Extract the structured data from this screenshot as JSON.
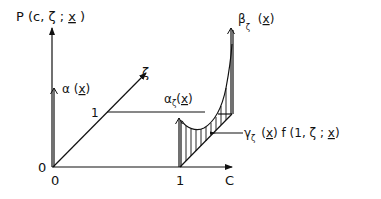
{
  "figure": {
    "type": "3d-probability-diagram",
    "axes": {
      "vertical": {
        "label": "P (c, ζ ; x)",
        "label_parts": [
          "P (c, ζ ; ",
          "x",
          " )"
        ]
      },
      "depth": {
        "label": "ζ"
      },
      "horizontal": {
        "label": "C"
      }
    },
    "ticks": {
      "origin_vertical": "0",
      "origin_horizontal": "0",
      "c_one": "1",
      "zeta_one": "1"
    },
    "annotations": {
      "alpha": {
        "symbol": "α",
        "open": " (",
        "arg": "x",
        "close": ")"
      },
      "alpha_zeta": {
        "symbol": "α",
        "sub": "ζ",
        "open": "(",
        "arg": "x",
        "close": ")"
      },
      "beta_zeta": {
        "symbol": "β",
        "sub": "ζ",
        "open": " (",
        "arg": "x",
        "close": ")"
      },
      "gamma_zeta": {
        "symbol": "γ",
        "sub": "ζ",
        "open": " (",
        "arg": "x",
        "mid": ") f (1, ζ ; ",
        "arg2": "x",
        "close": ")"
      }
    }
  }
}
